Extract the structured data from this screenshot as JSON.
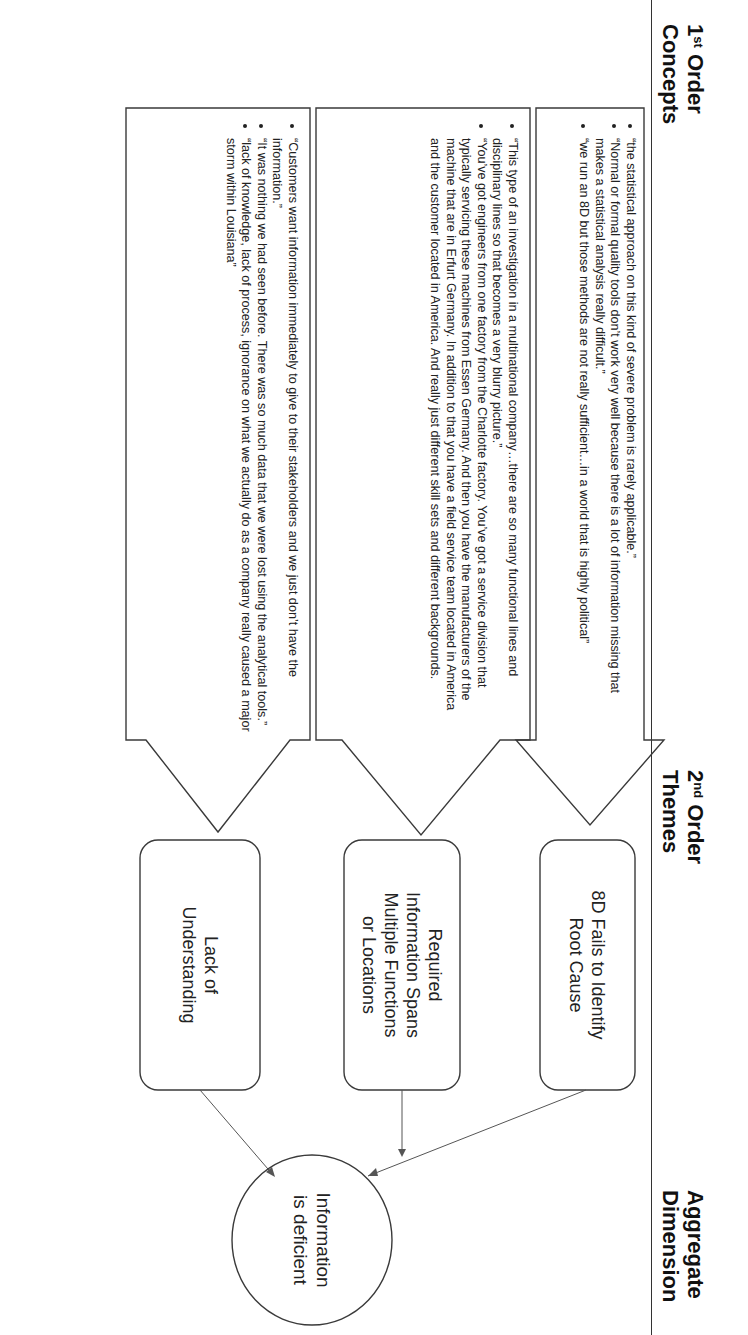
{
  "headers": {
    "first_order": {
      "num": "1",
      "sup": "st",
      "line1": " Order",
      "line2": "Concepts"
    },
    "second_order": {
      "num": "2",
      "sup": "nd",
      "line1": " Order",
      "line2": "Themes"
    },
    "aggregate": {
      "line1": "Aggregate",
      "line2": "Dimension"
    }
  },
  "concepts": [
    {
      "bullets": [
        "“the statistical approach on this kind of severe problem is rarely applicable.”",
        "“Normal or formal quality tools don’t work very well because there is a lot of information missing that makes a statistical analysis really difficult.”",
        "“we run an 8D but those methods are not really sufficient…in a world that is highly political”"
      ]
    },
    {
      "bullets": [
        "“This type of an investigation in a multinational company…there are so many functional lines and disciplinary lines so that becomes a very blurry picture.”",
        "“You’ve got engineers from one factory from the Charlotte factory. You’ve got a service division that typically servicing these machines from Essen Germany. And then you have the manufacturers of the machine that are in Erfurt Germany.  In addition to that you have a field service team located in America and the customer located in America. And really just different skill sets and different backgrounds."
      ]
    },
    {
      "bullets": [
        "“Customers want information immediately to give to their stakeholders and we just don’t have the information.”",
        "“It was nothing we had seen before. There was so much data that we were lost using the analytical tools.”",
        "“lack of knowledge, lack of process, ignorance on what we actually do as a company really caused a major storm within Louisiana”"
      ]
    }
  ],
  "themes": [
    {
      "lines": [
        "8D Fails to Identify",
        "Root Cause"
      ]
    },
    {
      "lines": [
        "Required",
        "Information Spans",
        "Multiple Functions",
        "or Locations"
      ]
    },
    {
      "lines": [
        "Lack of",
        "Understanding"
      ]
    }
  ],
  "aggregate_dimension": {
    "lines": [
      "Information",
      "is deficient"
    ]
  },
  "colors": {
    "stroke": "#3a3a3a",
    "text": "#222222",
    "background": "#ffffff"
  }
}
